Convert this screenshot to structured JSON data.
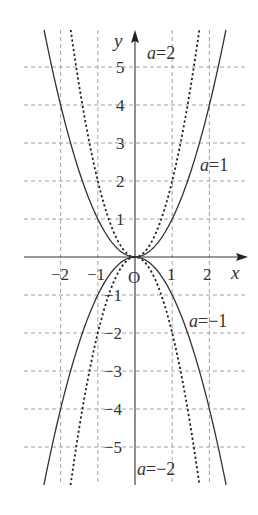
{
  "chart_data": {
    "type": "line",
    "title": "",
    "function_family": "y = a x^2",
    "xlabel": "x",
    "ylabel": "y",
    "origin_label": "O",
    "xlim": [
      -2.9,
      3.0
    ],
    "ylim": [
      -6.0,
      6.0
    ],
    "grid": "dashed",
    "x_ticks": [
      {
        "value": -2,
        "label": "−2"
      },
      {
        "value": -1,
        "label": "−1"
      },
      {
        "value": 1,
        "label": "1"
      },
      {
        "value": 2,
        "label": "2"
      }
    ],
    "y_ticks": [
      {
        "value": 5,
        "label": "5"
      },
      {
        "value": 4,
        "label": "4"
      },
      {
        "value": 3,
        "label": "3"
      },
      {
        "value": 2,
        "label": "2"
      },
      {
        "value": 1,
        "label": "1"
      },
      {
        "value": -1,
        "label": "−1"
      },
      {
        "value": -2,
        "label": "−2"
      },
      {
        "value": -3,
        "label": "−3"
      },
      {
        "value": -4,
        "label": "−4"
      },
      {
        "value": -5,
        "label": "−5"
      }
    ],
    "series": [
      {
        "name": "a=2",
        "a": 2,
        "style": "dotted",
        "label_var": "a",
        "label_rest": "=2"
      },
      {
        "name": "a=1",
        "a": 1,
        "style": "solid",
        "label_var": "a",
        "label_rest": "=1"
      },
      {
        "name": "a=−1",
        "a": -1,
        "style": "solid",
        "label_var": "a",
        "label_rest": "=−1"
      },
      {
        "name": "a=−2",
        "a": -2,
        "style": "dotted",
        "label_var": "a",
        "label_rest": "=−2"
      }
    ],
    "sample_points": {
      "a=1": [
        [
          -2,
          4
        ],
        [
          -1,
          1
        ],
        [
          0,
          0
        ],
        [
          1,
          1
        ],
        [
          2,
          4
        ]
      ],
      "a=2": [
        [
          -1.5,
          4.5
        ],
        [
          -1,
          2
        ],
        [
          0,
          0
        ],
        [
          1,
          2
        ],
        [
          1.5,
          4.5
        ]
      ],
      "a=-1": [
        [
          -2,
          -4
        ],
        [
          -1,
          -1
        ],
        [
          0,
          0
        ],
        [
          1,
          -1
        ],
        [
          2,
          -4
        ]
      ],
      "a=-2": [
        [
          -1.5,
          -4.5
        ],
        [
          -1,
          -2
        ],
        [
          0,
          0
        ],
        [
          1,
          -2
        ],
        [
          1.5,
          -4.5
        ]
      ]
    }
  },
  "labels": {
    "x_axis": "x",
    "y_axis": "y",
    "origin": "O"
  }
}
